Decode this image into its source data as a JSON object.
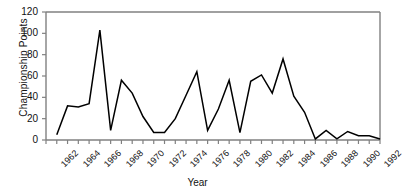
{
  "chart_data": {
    "type": "line",
    "title": "",
    "xlabel": "Year",
    "ylabel": "Championship Points",
    "xlim": [
      1962,
      1993
    ],
    "ylim": [
      0,
      120
    ],
    "ytick_labels": [
      "0",
      "20",
      "40",
      "60",
      "80",
      "100",
      "120"
    ],
    "ytick_values": [
      0,
      20,
      40,
      60,
      80,
      100,
      120
    ],
    "xtick_labels": [
      "1962",
      "1964",
      "1966",
      "1968",
      "1970",
      "1972",
      "1974",
      "1976",
      "1978",
      "1980",
      "1982",
      "1984",
      "1986",
      "1988",
      "1990",
      "1992"
    ],
    "xtick_values": [
      1962,
      1964,
      1966,
      1968,
      1970,
      1972,
      1974,
      1976,
      1978,
      1980,
      1982,
      1984,
      1986,
      1988,
      1990,
      1992
    ],
    "minor_ticks_every": 1,
    "grid": false,
    "legend": false,
    "line_color": "#000000",
    "axis_color": "#808080",
    "x": [
      1963,
      1964,
      1965,
      1966,
      1967,
      1968,
      1969,
      1970,
      1971,
      1972,
      1973,
      1974,
      1975,
      1976,
      1977,
      1978,
      1979,
      1980,
      1981,
      1982,
      1983,
      1984,
      1985,
      1986,
      1987,
      1988,
      1989,
      1990,
      1991,
      1992,
      1993
    ],
    "values": [
      5,
      32,
      31,
      34,
      103,
      9,
      56,
      44,
      22,
      7,
      7,
      20,
      42,
      64,
      9,
      29,
      56,
      7,
      55,
      61,
      44,
      76,
      41,
      26,
      1,
      9,
      1,
      8,
      4,
      4,
      1
    ],
    "series": [
      {
        "name": "Championship Points",
        "values": [
          5,
          32,
          31,
          34,
          103,
          9,
          56,
          44,
          22,
          7,
          7,
          20,
          42,
          64,
          9,
          29,
          56,
          7,
          55,
          61,
          44,
          76,
          41,
          26,
          1,
          9,
          1,
          8,
          4,
          4,
          1
        ]
      }
    ]
  }
}
